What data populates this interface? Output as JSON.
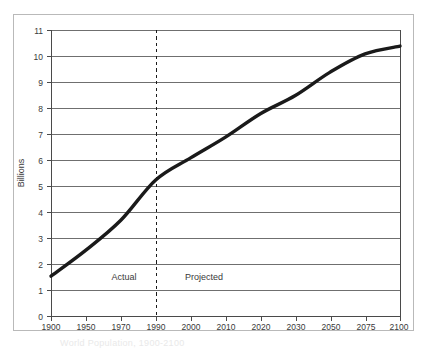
{
  "chart_data": {
    "type": "line",
    "title": "",
    "xlabel": "",
    "ylabel": "Billions",
    "ylim": [
      0,
      11
    ],
    "ytick_labels": [
      "0",
      "1",
      "2",
      "3",
      "4",
      "5",
      "6",
      "7",
      "8",
      "9",
      "10",
      "11"
    ],
    "ytick_values": [
      0,
      1,
      2,
      3,
      4,
      5,
      6,
      7,
      8,
      9,
      10,
      11
    ],
    "grid": true,
    "grid_axis": "y",
    "legend": "none",
    "categories": [
      "1900",
      "1950",
      "1970",
      "1990",
      "2000",
      "2010",
      "2020",
      "2030",
      "2050",
      "2075",
      "2100"
    ],
    "values": [
      1.55,
      2.55,
      3.7,
      5.25,
      6.1,
      6.9,
      7.8,
      8.5,
      9.4,
      10.1,
      10.4
    ],
    "series": [
      {
        "name": "World population",
        "color": "#1a1a1a",
        "values": [
          1.55,
          2.55,
          3.7,
          5.25,
          6.1,
          6.9,
          7.8,
          8.5,
          9.4,
          10.1,
          10.4
        ]
      }
    ],
    "annotations": [
      {
        "name": "divider",
        "type": "vline",
        "at_category": "1990",
        "style": "dashed",
        "color": "#1a1a1a"
      },
      {
        "name": "actual-label",
        "type": "text",
        "text": "Actual",
        "x_category_between": [
          "1950",
          "1970"
        ],
        "y": 1.5
      },
      {
        "name": "projected-label",
        "type": "text",
        "text": "Projected",
        "x_category_between": [
          "1990",
          "2000"
        ],
        "y": 1.5
      }
    ]
  },
  "axes": {
    "y_title": "Billions",
    "y_ticks": [
      "11",
      "10",
      "9",
      "8",
      "7",
      "6",
      "5",
      "4",
      "3",
      "2",
      "1",
      "0"
    ],
    "x_ticks": [
      "1900",
      "1950",
      "1970",
      "1990",
      "2000",
      "2010",
      "2020",
      "2030",
      "2050",
      "2075",
      "2100"
    ]
  },
  "regions": {
    "actual_label": "Actual",
    "projected_label": "Projected"
  },
  "caption": {
    "text": "World Population, 1900-2100"
  },
  "colors": {
    "line": "#1a1a1a",
    "grid": "#6f6f6f",
    "axis": "#4a4a4a",
    "frame": "#b9b9b9",
    "text": "#3a3a3a"
  }
}
